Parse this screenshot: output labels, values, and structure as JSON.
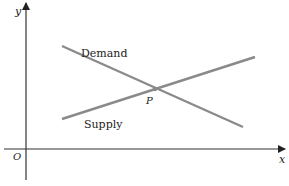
{
  "diagram": {
    "axes": {
      "x_label": "x",
      "y_label": "y",
      "origin_label": "O"
    },
    "curves": [
      {
        "name": "Demand",
        "label": "Demand",
        "from": [
          62,
          46
        ],
        "to": [
          243,
          127
        ]
      },
      {
        "name": "Supply",
        "label": "Supply",
        "from": [
          62,
          119
        ],
        "to": [
          255,
          57
        ]
      }
    ],
    "intersection": {
      "label": "P",
      "point": [
        155,
        89
      ]
    },
    "colors": {
      "axis": "#333333",
      "curve": "#8a8a8a",
      "text": "#222222"
    }
  }
}
